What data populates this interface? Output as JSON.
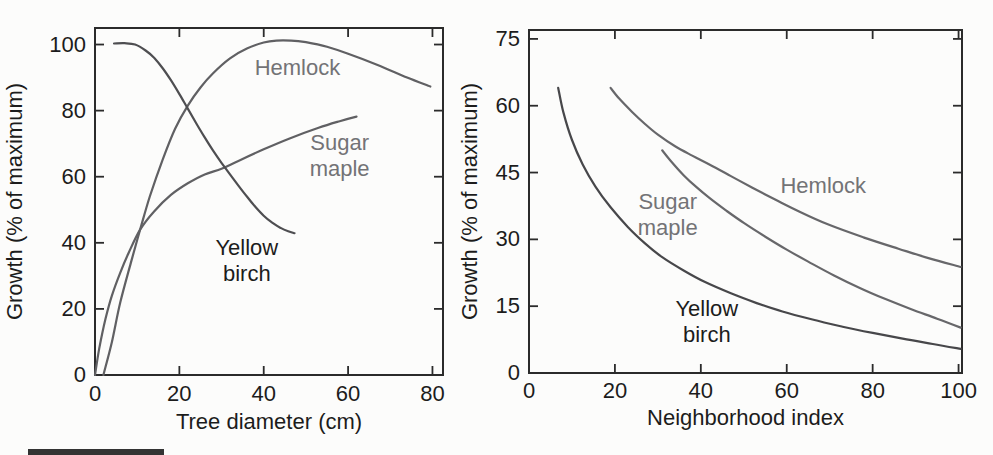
{
  "figure": {
    "background": "#fcfcfb",
    "text_color": "#1c1c1c",
    "axis_color": "#2b2b2b",
    "caption_bar": {
      "color": "#333333"
    }
  },
  "chart_data": [
    {
      "type": "line",
      "panel": "left",
      "title": "",
      "xlabel": "Tree diameter (cm)",
      "ylabel": "Growth (% of maximum)",
      "xlim": [
        0,
        82.5
      ],
      "ylim": [
        0,
        105
      ],
      "x_ticks": [
        0,
        20,
        40,
        60,
        80
      ],
      "y_ticks": [
        0,
        20,
        40,
        60,
        80,
        100
      ],
      "grid": false,
      "legend": "inline-labels",
      "series": [
        {
          "name": "Hemlock",
          "color": "#606063",
          "label_lines": [
            "Hemlock"
          ],
          "label_pos": [
            48,
            93.5
          ],
          "label_color": "#737376",
          "points": [
            [
              2,
              0
            ],
            [
              4,
              10
            ],
            [
              6,
              22
            ],
            [
              8.5,
              34
            ],
            [
              10.7,
              44
            ],
            [
              13,
              54
            ],
            [
              16,
              65
            ],
            [
              19,
              74.5
            ],
            [
              22,
              81.5
            ],
            [
              25,
              87
            ],
            [
              28,
              91.3
            ],
            [
              32,
              95.8
            ],
            [
              36,
              98.8
            ],
            [
              40,
              100.6
            ],
            [
              43,
              101.2
            ],
            [
              46.5,
              101.2
            ],
            [
              50,
              100.7
            ],
            [
              55,
              99.3
            ],
            [
              60,
              97.2
            ],
            [
              67,
              93.8
            ],
            [
              74,
              90
            ],
            [
              79.5,
              87.3
            ]
          ]
        },
        {
          "name": "Sugar maple",
          "color": "#606063",
          "label_lines": [
            "Sugar",
            "maple"
          ],
          "label_pos": [
            58,
            67
          ],
          "label_color": "#737376",
          "points": [
            [
              0,
              0
            ],
            [
              1,
              8
            ],
            [
              2.5,
              17
            ],
            [
              4,
              24
            ],
            [
              6,
              31
            ],
            [
              8,
              37
            ],
            [
              10.7,
              44
            ],
            [
              14,
              49.5
            ],
            [
              18,
              54.5
            ],
            [
              22,
              58
            ],
            [
              26,
              60.7
            ],
            [
              30,
              62.4
            ],
            [
              34,
              64.8
            ],
            [
              40,
              68.3
            ],
            [
              46,
              71.5
            ],
            [
              53,
              74.8
            ],
            [
              58,
              76.8
            ],
            [
              62,
              78.2
            ]
          ]
        },
        {
          "name": "Yellow birch",
          "color": "#4e4e51",
          "label_lines": [
            "Yellow",
            "birch"
          ],
          "label_pos": [
            36,
            35
          ],
          "label_color": "#1c1c1c",
          "points": [
            [
              4.5,
              100.3
            ],
            [
              7,
              100.4
            ],
            [
              9.5,
              100
            ],
            [
              12,
              98.2
            ],
            [
              14,
              96
            ],
            [
              16,
              92.9
            ],
            [
              18,
              89.2
            ],
            [
              20,
              85
            ],
            [
              22,
              80.6
            ],
            [
              24,
              76.2
            ],
            [
              26,
              71.9
            ],
            [
              28,
              67.9
            ],
            [
              30,
              64.2
            ],
            [
              32,
              60.7
            ],
            [
              34,
              57.3
            ],
            [
              36,
              54
            ],
            [
              38,
              50.9
            ],
            [
              40,
              48.2
            ],
            [
              42,
              46.1
            ],
            [
              44,
              44.5
            ],
            [
              45.8,
              43.5
            ],
            [
              47.3,
              42.9
            ]
          ]
        }
      ]
    },
    {
      "type": "line",
      "panel": "right",
      "title": "",
      "xlabel": "Neighborhood index",
      "ylabel": "Growth (% of maximum)",
      "xlim": [
        0,
        100.8
      ],
      "ylim": [
        0,
        77
      ],
      "x_ticks": [
        0,
        20,
        40,
        60,
        80,
        100
      ],
      "y_ticks": [
        0,
        15,
        30,
        45,
        60,
        75
      ],
      "grid": false,
      "legend": "inline-labels",
      "series": [
        {
          "name": "Hemlock",
          "color": "#67676a",
          "label_lines": [
            "Hemlock"
          ],
          "label_pos": [
            68.5,
            42.4
          ],
          "label_color": "#737376",
          "points": [
            [
              19,
              64
            ],
            [
              21,
              61.6
            ],
            [
              24,
              58.6
            ],
            [
              27,
              55.9
            ],
            [
              30,
              53.5
            ],
            [
              34,
              50.9
            ],
            [
              38,
              48.8
            ],
            [
              42,
              46.8
            ],
            [
              47,
              44.2
            ],
            [
              52,
              41.6
            ],
            [
              58,
              38.6
            ],
            [
              63,
              36.2
            ],
            [
              70,
              33.2
            ],
            [
              78,
              30.4
            ],
            [
              86,
              27.9
            ],
            [
              93,
              25.8
            ],
            [
              100.5,
              23.8
            ]
          ]
        },
        {
          "name": "Sugar maple",
          "color": "#67676a",
          "label_lines": [
            "Sugar",
            "maple"
          ],
          "label_pos": [
            32.3,
            36
          ],
          "label_color": "#737376",
          "points": [
            [
              31,
              50
            ],
            [
              33,
              47.6
            ],
            [
              36,
              44.4
            ],
            [
              39,
              41.7
            ],
            [
              42,
              39.3
            ],
            [
              46,
              36.4
            ],
            [
              50,
              33.7
            ],
            [
              55,
              30.6
            ],
            [
              60,
              27.7
            ],
            [
              65,
              25
            ],
            [
              71,
              21.9
            ],
            [
              77,
              19.1
            ],
            [
              83,
              16.6
            ],
            [
              89,
              14.3
            ],
            [
              95,
              12.2
            ],
            [
              100.5,
              10.2
            ]
          ]
        },
        {
          "name": "Yellow birch",
          "color": "#47474a",
          "label_lines": [
            "Yellow",
            "birch"
          ],
          "label_pos": [
            41.4,
            12
          ],
          "label_color": "#1c1c1c",
          "points": [
            [
              6.8,
              64
            ],
            [
              8,
              58.5
            ],
            [
              10,
              52.3
            ],
            [
              12.5,
              46.8
            ],
            [
              15.5,
              41.8
            ],
            [
              19,
              37.2
            ],
            [
              23,
              32.8
            ],
            [
              27,
              29.1
            ],
            [
              31,
              26
            ],
            [
              36,
              23
            ],
            [
              41,
              20.4
            ],
            [
              47,
              17.9
            ],
            [
              53,
              15.7
            ],
            [
              59,
              13.8
            ],
            [
              66,
              12
            ],
            [
              73,
              10.4
            ],
            [
              80,
              9
            ],
            [
              87,
              7.7
            ],
            [
              94,
              6.5
            ],
            [
              100.5,
              5.4
            ]
          ]
        }
      ]
    }
  ]
}
